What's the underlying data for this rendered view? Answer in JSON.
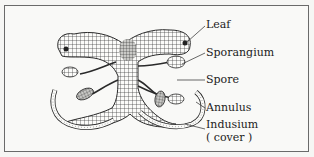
{
  "figure": {
    "labels": [
      {
        "id": "leaf",
        "text": "Leaf"
      },
      {
        "id": "sporangium",
        "text": "Sporangium"
      },
      {
        "id": "spore",
        "text": "Spore"
      },
      {
        "id": "annulus",
        "text": "Annulus"
      },
      {
        "id": "indusium",
        "text": "Indusium"
      },
      {
        "id": "indusium-note",
        "text": "( cover )"
      }
    ],
    "colors": {
      "ink": "#2a2a2a",
      "paper": "#f9f9f7",
      "frame": "#6a6a6a"
    }
  }
}
